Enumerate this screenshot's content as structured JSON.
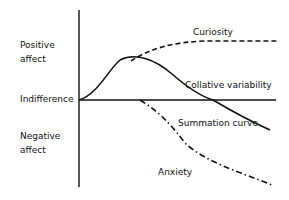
{
  "diagram": {
    "axis_labels": {
      "positive": [
        "Positive",
        "affect"
      ],
      "indifference": "Indifference",
      "negative": [
        "Negative",
        "affect"
      ]
    },
    "curves": {
      "curiosity": {
        "label": "Curiosity",
        "style": "dashed"
      },
      "collative": {
        "label": "Collative variability",
        "style": "solid"
      },
      "summation": {
        "label": "Summation curve",
        "style": "solid"
      },
      "anxiety": {
        "label": "Anxiety",
        "style": "dash-dot"
      }
    },
    "colors": {
      "line": "#111111",
      "background": "#ffffff"
    }
  }
}
